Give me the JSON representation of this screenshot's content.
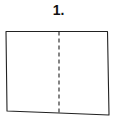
{
  "step": {
    "label": "1."
  },
  "diagram": {
    "type": "fold-instruction",
    "shape": "rectangle-paper",
    "fold_line": "vertical-dashed-center",
    "colors": {
      "stroke": "#222222",
      "fill": "#ffffff"
    }
  }
}
